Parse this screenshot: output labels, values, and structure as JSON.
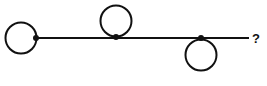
{
  "diagram": {
    "stroke_color": "#111111",
    "background": "#ffffff",
    "line": {
      "x1": 35,
      "y1": 38,
      "x2": 249,
      "y2": 38,
      "width": 2
    },
    "circles": [
      {
        "id": "left",
        "cx": 21,
        "cy": 38,
        "r": 15.5,
        "position": "left-of-junction"
      },
      {
        "id": "middle",
        "cx": 116,
        "cy": 21,
        "r": 15.5,
        "position": "above-line"
      },
      {
        "id": "right",
        "cx": 201,
        "cy": 55,
        "r": 15.5,
        "position": "below-line"
      }
    ],
    "dots": [
      {
        "cx": 36,
        "cy": 38,
        "r": 3
      },
      {
        "cx": 116,
        "cy": 37,
        "r": 3
      },
      {
        "cx": 201,
        "cy": 38,
        "r": 3
      }
    ],
    "end_label": "?"
  }
}
